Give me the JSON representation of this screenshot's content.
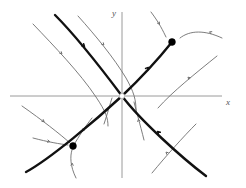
{
  "figure": {
    "kind": "phase-portrait",
    "background": "#ffffff",
    "width": 246,
    "height": 188
  },
  "axes": {
    "x_label": "x",
    "y_label": "y",
    "color": "#9a9a9a",
    "origin": [
      122,
      96
    ],
    "x_axis": {
      "x1": 10,
      "y1": 96,
      "x2": 222,
      "y2": 96
    },
    "y_axis": {
      "x1": 122,
      "y1": 12,
      "x2": 122,
      "y2": 178
    },
    "x_label_pos": [
      226,
      105
    ],
    "y_label_pos": [
      112,
      16
    ]
  },
  "colors": {
    "manifold": "#111111",
    "trajectory": "#6e6e6e",
    "fixed_point": "#000000",
    "axis": "#9a9a9a"
  },
  "chart_data": {
    "type": "scatter",
    "title": "",
    "xlabel": "x",
    "ylabel": "y",
    "fixed_points": [
      {
        "name": "saddle-origin",
        "x": 122,
        "y": 96,
        "type": "saddle",
        "marker": "open"
      },
      {
        "name": "sink-upper-right",
        "x": 172,
        "y": 42,
        "type": "sink",
        "marker": "filled"
      },
      {
        "name": "sink-lower-left",
        "x": 73,
        "y": 146,
        "type": "sink",
        "marker": "filled"
      }
    ],
    "manifolds": [
      {
        "name": "stable-manifold",
        "style": "thick",
        "path": "M55,15 C78,38 104,72 122,96 C140,120 182,158 206,176",
        "arrows": [
          {
            "x": 82,
            "y": 44,
            "angle": 45
          },
          {
            "x": 160,
            "y": 134,
            "angle": 225
          }
        ]
      },
      {
        "name": "unstable-manifold",
        "style": "thick",
        "path": "M26,172 C50,159 96,120 122,96 C142,77 160,57 172,42",
        "arrows": [
          {
            "x": 146,
            "y": 70,
            "angle": -49
          }
        ]
      }
    ],
    "trajectories": [
      {
        "name": "traj-upper-left-outer",
        "path": "M33,24 C54,46 80,73 96,97 C106,112 108,118 108,126",
        "arrows": [
          {
            "x": 60,
            "y": 52,
            "angle": 45
          }
        ]
      },
      {
        "name": "traj-upper-left-inner",
        "path": "M78,16 C96,36 114,58 126,78 C134,92 136,100 136,110",
        "arrows": [
          {
            "x": 102,
            "y": 43,
            "angle": 47
          }
        ]
      },
      {
        "name": "traj-upper-right-to-sink",
        "path": "M151,12 C160,24 163,31 166,37",
        "arrows": [
          {
            "x": 158,
            "y": 22,
            "angle": 57
          }
        ]
      },
      {
        "name": "traj-right-into-sink",
        "path": "M222,38 C205,30 190,30 180,38",
        "arrows": [
          {
            "x": 212,
            "y": 33,
            "angle": 205
          }
        ]
      },
      {
        "name": "traj-lower-right-upper",
        "path": "M217,56 C196,73 172,92 158,108",
        "arrows": [
          {
            "x": 190,
            "y": 79,
            "angle": 222
          }
        ]
      },
      {
        "name": "traj-lower-right-lower",
        "path": "M152,173 C166,156 184,136 196,124",
        "arrows": [
          {
            "x": 168,
            "y": 154,
            "angle": 223
          }
        ]
      },
      {
        "name": "traj-below-origin",
        "path": "M144,140 C140,124 136,110 134,102",
        "arrows": [
          {
            "x": 139,
            "y": 122,
            "angle": 256
          }
        ]
      },
      {
        "name": "traj-left-of-origin",
        "path": "M104,124 C108,112 110,104 112,98",
        "arrows": [
          {
            "x": 107,
            "y": 112,
            "angle": 250
          }
        ]
      },
      {
        "name": "traj-lower-left-outer",
        "path": "M22,106 C42,120 60,134 70,143",
        "arrows": [
          {
            "x": 42,
            "y": 120,
            "angle": 38
          }
        ]
      },
      {
        "name": "traj-lower-left-inner",
        "path": "M33,138 C48,142 60,144 68,145",
        "arrows": [
          {
            "x": 47,
            "y": 141,
            "angle": 12
          }
        ]
      },
      {
        "name": "traj-below-sink",
        "path": "M76,178 C70,166 70,156 72,150",
        "arrows": [
          {
            "x": 72,
            "y": 166,
            "angle": 275
          }
        ]
      },
      {
        "name": "traj-upper-into-sink",
        "path": "M92,118 C84,128 78,138 75,143",
        "arrows": [
          {
            "x": 84,
            "y": 129,
            "angle": 130
          }
        ]
      }
    ]
  }
}
